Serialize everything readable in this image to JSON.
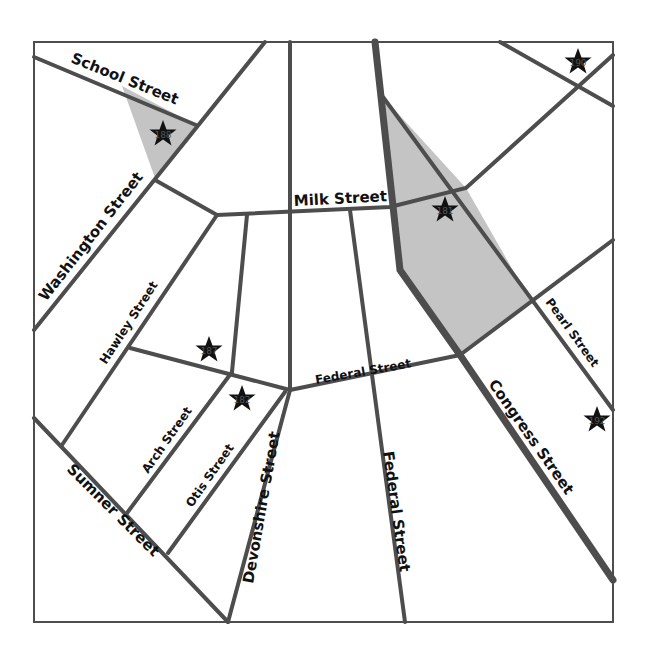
{
  "map": {
    "colors": {
      "background": "#ffffff",
      "road": "#4d4d4d",
      "highlight_fill": "#c4c4c4",
      "frame": "#4d4d4d",
      "label": "#111111",
      "star": "#111111"
    },
    "streets": [
      {
        "id": "school",
        "label": "School Street"
      },
      {
        "id": "washington",
        "label": "Washington Street"
      },
      {
        "id": "milk",
        "label": "Milk Street"
      },
      {
        "id": "hawley",
        "label": "Hawley Street"
      },
      {
        "id": "federal-h",
        "label": "Federal Street"
      },
      {
        "id": "federal-v",
        "label": "Federal Street"
      },
      {
        "id": "pearl",
        "label": "Pearl Street"
      },
      {
        "id": "congress",
        "label": "Congress Street"
      },
      {
        "id": "arch",
        "label": "Arch Street"
      },
      {
        "id": "otis",
        "label": "Otis Street"
      },
      {
        "id": "sumner",
        "label": "Sumner Street"
      },
      {
        "id": "devonshire",
        "label": "Devonshire Street"
      }
    ],
    "markers": [
      {
        "label": "188",
        "x": 163,
        "y": 134
      },
      {
        "label": "181",
        "x": 445,
        "y": 210
      },
      {
        "label": "190",
        "x": 578,
        "y": 62
      },
      {
        "label": "192",
        "x": 597,
        "y": 420
      },
      {
        "label": "187",
        "x": 209,
        "y": 350
      },
      {
        "label": "182",
        "x": 242,
        "y": 399
      }
    ]
  }
}
